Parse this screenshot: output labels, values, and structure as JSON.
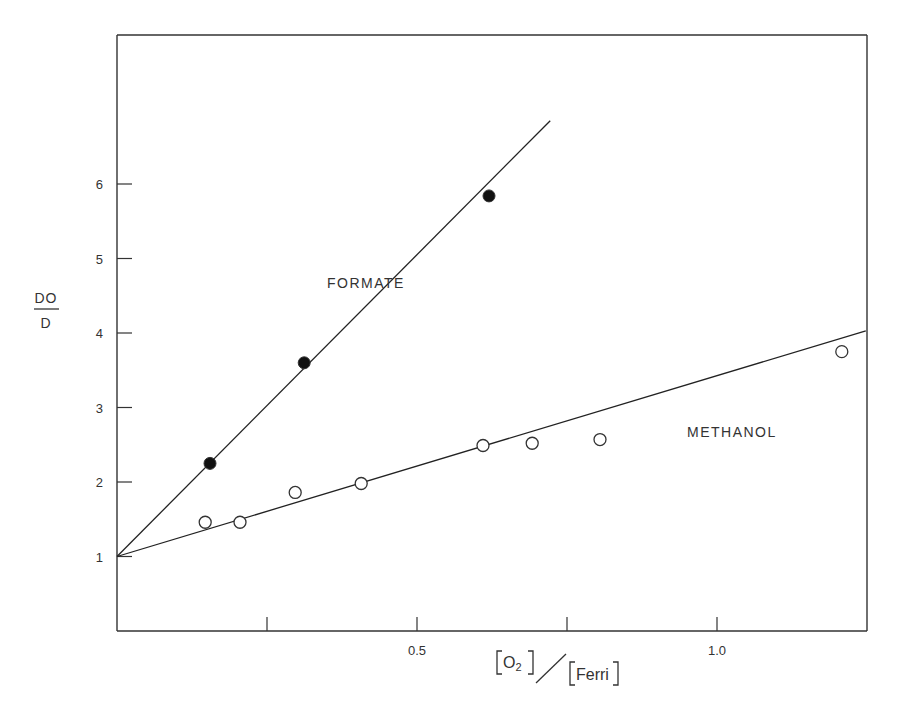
{
  "chart_data": {
    "type": "scatter",
    "title": "",
    "xlabel": "[O2] / [Ferri]",
    "xlabel_parts": {
      "num_species": "O",
      "num_sub": "2",
      "den_species": "Ferri"
    },
    "ylabel": "DO / D",
    "ylabel_parts": {
      "numerator": "DO",
      "denominator": "D"
    },
    "xlim": [
      0,
      1.25
    ],
    "ylim": [
      0,
      8
    ],
    "x_ticks": [
      0.25,
      0.5,
      0.75,
      1.0
    ],
    "x_tick_labels": [
      "",
      "0.5",
      "",
      "1.0"
    ],
    "y_ticks": [
      1,
      2,
      3,
      4,
      5,
      6
    ],
    "y_tick_labels": [
      "1",
      "2",
      "3",
      "4",
      "5",
      "6"
    ],
    "grid": false,
    "legend": "none (series labeled inline)",
    "series": [
      {
        "name": "FORMATE",
        "marker": "filled-circle",
        "label_at": [
          0.35,
          4.6
        ],
        "x": [
          0.155,
          0.312,
          0.62
        ],
        "y": [
          2.25,
          3.6,
          5.84
        ],
        "fit_line": {
          "x": [
            0,
            0.722
          ],
          "y": [
            1.0,
            6.85
          ]
        }
      },
      {
        "name": "METHANOL",
        "marker": "open-circle",
        "label_at": [
          0.95,
          2.6
        ],
        "x": [
          0.147,
          0.205,
          0.297,
          0.407,
          0.61,
          0.692,
          0.805,
          1.208
        ],
        "y": [
          1.46,
          1.46,
          1.86,
          1.98,
          2.49,
          2.52,
          2.57,
          3.75
        ],
        "fit_line": {
          "x": [
            0,
            1.248
          ],
          "y": [
            1.0,
            4.03
          ]
        }
      }
    ]
  }
}
